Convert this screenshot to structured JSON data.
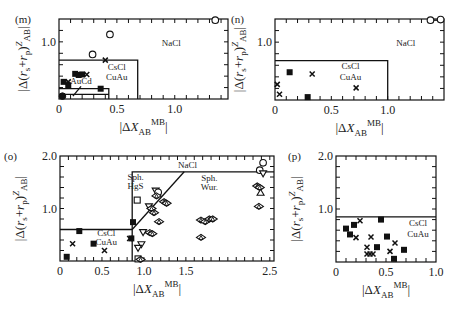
{
  "chart_data": [
    {
      "id": "m",
      "type": "scatter",
      "panel_label": "(m)",
      "xlabel": "|ΔX_AB^MB|",
      "ylabel": "|Δ(r_s+r_p)^Z_AB|",
      "xlim": [
        0,
        1.46
      ],
      "ylim": [
        0,
        1.4
      ],
      "xticks": [
        {
          "v": 0,
          "t": "0"
        },
        {
          "v": 0.5,
          "t": "0.5"
        },
        {
          "v": 1.0,
          "t": "1.0"
        }
      ],
      "yticks": [
        {
          "v": 1.0,
          "t": "1.0"
        }
      ],
      "minor_x": 0.1,
      "minor_y": 0.2,
      "boundaries": [
        {
          "points": [
            [
              0,
              0.68
            ],
            [
              0.68,
              0.68
            ],
            [
              0.68,
              0
            ]
          ]
        },
        {
          "points": [
            [
              0,
              0.18
            ],
            [
              0.43,
              0.18
            ],
            [
              0.43,
              0
            ]
          ]
        },
        {
          "points": [
            [
              0,
              0.08
            ],
            [
              0.43,
              0.08
            ]
          ]
        },
        {
          "points": [
            [
              0.12,
              0.05
            ],
            [
              0.19,
              0.22
            ]
          ]
        }
      ],
      "region_labels": [
        {
          "text": "NaCl",
          "x": 0.97,
          "y": 0.93
        },
        {
          "text": "CsCl",
          "x": 0.5,
          "y": 0.5
        },
        {
          "text": "CuAu",
          "x": 0.5,
          "y": 0.34
        },
        {
          "text": "AuCd",
          "x": 0.19,
          "y": 0.26
        }
      ],
      "points": [
        {
          "x": 1.35,
          "y": 1.38,
          "m": "circle"
        },
        {
          "x": 0.44,
          "y": 1.13,
          "m": "circle"
        },
        {
          "x": 0.29,
          "y": 0.78,
          "m": "circle"
        },
        {
          "x": 0.4,
          "y": 0.68,
          "m": "cross"
        },
        {
          "x": 0.14,
          "y": 0.44,
          "m": "square"
        },
        {
          "x": 0.17,
          "y": 0.42,
          "m": "square"
        },
        {
          "x": 0.2,
          "y": 0.43,
          "m": "square"
        },
        {
          "x": 0.24,
          "y": 0.43,
          "m": "cross"
        },
        {
          "x": 0.04,
          "y": 0.3,
          "m": "square"
        },
        {
          "x": 0.08,
          "y": 0.3,
          "m": "cross"
        },
        {
          "x": 0.08,
          "y": 0.24,
          "m": "square"
        },
        {
          "x": 0.36,
          "y": 0.18,
          "m": "square"
        },
        {
          "x": 0.03,
          "y": 0.05,
          "m": "circle-filled"
        }
      ]
    },
    {
      "id": "n",
      "type": "scatter",
      "panel_label": "(n)",
      "xlabel": "|ΔX_AB^MB|",
      "ylabel": "|Δ(r_s+r_p)^Z_AB|",
      "xlim": [
        0,
        1.5
      ],
      "ylim": [
        0,
        1.4
      ],
      "xticks": [
        {
          "v": 0,
          "t": "0"
        },
        {
          "v": 0.5,
          "t": "0.5"
        },
        {
          "v": 1.0,
          "t": "1.0"
        }
      ],
      "yticks": [
        {
          "v": 1.0,
          "t": "1.0"
        }
      ],
      "minor_x": 0.1,
      "minor_y": 0.2,
      "boundaries": [
        {
          "points": [
            [
              0,
              0.68
            ],
            [
              1.0,
              0.68
            ],
            [
              1.0,
              0
            ]
          ]
        },
        {
          "points": [
            [
              1.38,
              1.38
            ],
            [
              1.47,
              1.38
            ]
          ]
        }
      ],
      "region_labels": [
        {
          "text": "NaCl",
          "x": 1.16,
          "y": 0.94
        },
        {
          "text": "CsCl",
          "x": 0.67,
          "y": 0.53
        },
        {
          "text": "CuAu",
          "x": 0.67,
          "y": 0.34
        }
      ],
      "points": [
        {
          "x": 1.38,
          "y": 1.38,
          "m": "circle"
        },
        {
          "x": 1.47,
          "y": 1.39,
          "m": "circle"
        },
        {
          "x": 0.13,
          "y": 0.48,
          "m": "square"
        },
        {
          "x": 0.33,
          "y": 0.45,
          "m": "cross"
        },
        {
          "x": 0.02,
          "y": 0.27,
          "m": "cross"
        },
        {
          "x": 0.72,
          "y": 0.21,
          "m": "cross"
        },
        {
          "x": 0.04,
          "y": 0.1,
          "m": "cross"
        },
        {
          "x": 0.29,
          "y": 0.05,
          "m": "square"
        }
      ]
    },
    {
      "id": "o",
      "type": "scatter",
      "panel_label": "(o)",
      "xlabel": "|ΔX_AB^MB|",
      "ylabel": "|Δ(r_s+r_p)^Z_AB|",
      "xlim": [
        0,
        2.55
      ],
      "ylim": [
        0,
        2.0
      ],
      "xticks": [
        {
          "v": 0,
          "t": "0"
        },
        {
          "v": 0.5,
          "t": "0.5"
        },
        {
          "v": 1.0,
          "t": "1.0"
        },
        {
          "v": 1.5,
          "t": "1.5"
        },
        {
          "v": 2.5,
          "t": "2.5"
        }
      ],
      "yticks": [
        {
          "v": 2.0,
          "t": "2.0"
        },
        {
          "v": 1.0,
          "t": "1.0"
        }
      ],
      "minor_x": 0.1,
      "minor_y": 0.2,
      "boundaries": [
        {
          "points": [
            [
              0,
              0.6
            ],
            [
              0.86,
              0.6
            ],
            [
              0.86,
              0
            ]
          ]
        },
        {
          "points": [
            [
              0.86,
              0.6
            ],
            [
              0.86,
              1.7
            ],
            [
              2.55,
              1.7
            ]
          ]
        },
        {
          "points": [
            [
              0.86,
              0.6
            ],
            [
              1.48,
              1.7
            ]
          ]
        }
      ],
      "region_labels": [
        {
          "text": "NaCl",
          "x": 1.52,
          "y": 1.78
        },
        {
          "text": "Sph.",
          "x": 0.9,
          "y": 1.55
        },
        {
          "text": "HgS",
          "x": 0.9,
          "y": 1.38
        },
        {
          "text": "Sph.",
          "x": 1.78,
          "y": 1.52
        },
        {
          "text": "Wur.",
          "x": 1.78,
          "y": 1.35
        },
        {
          "text": "CsCl",
          "x": 0.55,
          "y": 0.48
        },
        {
          "text": "CuAu",
          "x": 0.55,
          "y": 0.3
        }
      ],
      "points": [
        {
          "x": 2.42,
          "y": 1.87,
          "m": "circle"
        },
        {
          "x": 2.38,
          "y": 1.73,
          "m": "circle"
        },
        {
          "x": 2.42,
          "y": 1.67,
          "m": "tri-down"
        },
        {
          "x": 2.35,
          "y": 1.43,
          "m": "diamond"
        },
        {
          "x": 2.38,
          "y": 1.4,
          "m": "diamond"
        },
        {
          "x": 2.39,
          "y": 1.3,
          "m": "triangle"
        },
        {
          "x": 2.37,
          "y": 1.04,
          "m": "diamond"
        },
        {
          "x": 1.68,
          "y": 0.78,
          "m": "diamond"
        },
        {
          "x": 1.73,
          "y": 0.75,
          "m": "diamond"
        },
        {
          "x": 1.78,
          "y": 0.8,
          "m": "diamond"
        },
        {
          "x": 1.82,
          "y": 0.8,
          "m": "diamond"
        },
        {
          "x": 1.68,
          "y": 0.45,
          "m": "diamond"
        },
        {
          "x": 1.14,
          "y": 1.34,
          "m": "tri-down"
        },
        {
          "x": 1.17,
          "y": 1.31,
          "m": "circle"
        },
        {
          "x": 1.15,
          "y": 1.24,
          "m": "diamond"
        },
        {
          "x": 1.24,
          "y": 1.13,
          "m": "diamond"
        },
        {
          "x": 1.27,
          "y": 1.1,
          "m": "diamond"
        },
        {
          "x": 1.06,
          "y": 1.04,
          "m": "tri-down"
        },
        {
          "x": 1.09,
          "y": 1.0,
          "m": "diamond"
        },
        {
          "x": 1.12,
          "y": 0.92,
          "m": "diamond"
        },
        {
          "x": 1.18,
          "y": 0.75,
          "m": "diamond"
        },
        {
          "x": 0.92,
          "y": 1.16,
          "m": "square"
        },
        {
          "x": 0.87,
          "y": 0.74,
          "m": "square"
        },
        {
          "x": 0.99,
          "y": 0.55,
          "m": "tri-down"
        },
        {
          "x": 1.07,
          "y": 0.54,
          "m": "diamond"
        },
        {
          "x": 1.1,
          "y": 0.52,
          "m": "diamond"
        },
        {
          "x": 0.97,
          "y": 0.32,
          "m": "tri-down"
        },
        {
          "x": 0.93,
          "y": 0.25,
          "m": "tri-down"
        },
        {
          "x": 0.93,
          "y": 0.04,
          "m": "square"
        },
        {
          "x": 0.96,
          "y": 0.03,
          "m": "diamond"
        },
        {
          "x": 0.83,
          "y": 0.43,
          "m": "cross"
        },
        {
          "x": 0.85,
          "y": 0.43,
          "m": "square"
        },
        {
          "x": 0.23,
          "y": 0.57,
          "m": "square"
        },
        {
          "x": 0.15,
          "y": 0.33,
          "m": "cross"
        },
        {
          "x": 0.4,
          "y": 0.33,
          "m": "square"
        },
        {
          "x": 0.53,
          "y": 0.2,
          "m": "cross"
        },
        {
          "x": 0.08,
          "y": 0.08,
          "m": "square"
        }
      ]
    },
    {
      "id": "p",
      "type": "scatter",
      "panel_label": "(p)",
      "xlabel": "|ΔX_AB^MB|",
      "ylabel": "|Δ(r_s+r_p)^Z_AB|",
      "xlim": [
        0,
        1.0
      ],
      "ylim": [
        0,
        2.0
      ],
      "xticks": [
        {
          "v": 0,
          "t": "0"
        },
        {
          "v": 0.5,
          "t": "0.5"
        },
        {
          "v": 1.0,
          "t": "1.0"
        }
      ],
      "yticks": [
        {
          "v": 2.0,
          "t": "2.0"
        },
        {
          "v": 1.0,
          "t": "1.0"
        }
      ],
      "minor_x": 0.1,
      "minor_y": 0.2,
      "boundaries": [
        {
          "points": [
            [
              0,
              0.85
            ],
            [
              1.0,
              0.85
            ]
          ]
        }
      ],
      "region_labels": [
        {
          "text": "CsCl",
          "x": 0.82,
          "y": 0.67
        },
        {
          "text": "CuAu",
          "x": 0.82,
          "y": 0.47
        }
      ],
      "points": [
        {
          "x": 0.45,
          "y": 0.8,
          "m": "square"
        },
        {
          "x": 0.24,
          "y": 0.78,
          "m": "cross"
        },
        {
          "x": 0.18,
          "y": 0.7,
          "m": "square"
        },
        {
          "x": 0.1,
          "y": 0.63,
          "m": "square"
        },
        {
          "x": 0.14,
          "y": 0.52,
          "m": "square"
        },
        {
          "x": 0.2,
          "y": 0.46,
          "m": "cross"
        },
        {
          "x": 0.35,
          "y": 0.47,
          "m": "cross"
        },
        {
          "x": 0.51,
          "y": 0.48,
          "m": "square"
        },
        {
          "x": 0.59,
          "y": 0.36,
          "m": "cross"
        },
        {
          "x": 0.31,
          "y": 0.28,
          "m": "cross"
        },
        {
          "x": 0.41,
          "y": 0.28,
          "m": "square"
        },
        {
          "x": 0.68,
          "y": 0.23,
          "m": "square"
        },
        {
          "x": 0.54,
          "y": 0.2,
          "m": "cross"
        },
        {
          "x": 0.31,
          "y": 0.15,
          "m": "cross"
        },
        {
          "x": 0.34,
          "y": 0.15,
          "m": "cross"
        },
        {
          "x": 0.37,
          "y": 0.15,
          "m": "cross"
        },
        {
          "x": 0.58,
          "y": 0.06,
          "m": "square"
        }
      ]
    }
  ]
}
